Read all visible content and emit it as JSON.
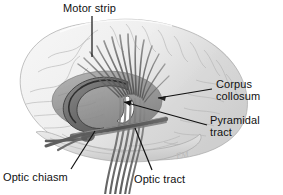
{
  "figure": {
    "type": "anatomical-illustration",
    "style": "grayscale pen-and-ink medical illustration",
    "background_color": "#ffffff",
    "ink_color": "#111111",
    "signature": "EM"
  },
  "labels": {
    "motor_strip": "Motor strip",
    "corpus_callosum_line1": "Corpus",
    "corpus_callosum_line2": "collosum",
    "pyramidal_line1": "Pyramidal",
    "pyramidal_line2": "tract",
    "optic_chiasm": "Optic chiasm",
    "optic_tract": "Optic tract"
  },
  "structures": [
    {
      "name": "cerebral-cortex",
      "tone": "#efefef",
      "description": "lateral cerebral hemisphere with gyri and sulci"
    },
    {
      "name": "corpus-callosum",
      "tone": "#6d6d6d",
      "description": "arching C-shaped commissural band"
    },
    {
      "name": "lateral-ventricle",
      "tone": "#ffffff",
      "description": "white crescent cavity"
    },
    {
      "name": "thalamus-basal-ganglia",
      "tone": "#9a9a9a",
      "description": "deep grey nuclei beneath corpus callosum"
    },
    {
      "name": "pyramidal-tract",
      "tone": "#6b6b6b",
      "description": "fibers fanning from motor strip converging and descending through internal capsule to brainstem"
    },
    {
      "name": "optic-chiasm",
      "tone": "#5a5a5a",
      "description": "X-shaped crossing of optic nerves below the hypothalamus"
    },
    {
      "name": "optic-tract",
      "tone": "#5a5a5a",
      "description": "band running posterolaterally from the chiasm"
    },
    {
      "name": "temporal-lobe",
      "tone": "#e2e2e2",
      "description": "inferior lobe forming lower brain contour"
    },
    {
      "name": "brainstem",
      "tone": "#8a8a8a",
      "description": "descending stalk exiting bottom of frame"
    }
  ]
}
